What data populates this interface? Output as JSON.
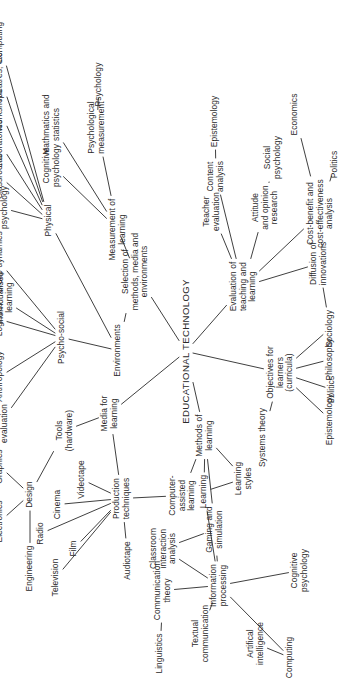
{
  "document": {
    "title": "EDUCATIONAL TECHNOLOGY",
    "type": "mind-map",
    "orientation": "rotated-90-ccw",
    "background_color": "#ffffff",
    "ink_color": "#2a2a2a"
  },
  "chart_data": {
    "type": "diagram",
    "title": "EDUCATIONAL TECHNOLOGY",
    "root": "EDUCATIONAL TECHNOLOGY",
    "nodes": [
      {
        "id": "root",
        "label": "EDUCATIONAL TECHNOLOGY",
        "x": 330,
        "y": 186,
        "cls": "root",
        "rot": 0
      },
      {
        "id": "media",
        "label": "Media for\nlearning",
        "x": 268,
        "y": 110,
        "rot": 0
      },
      {
        "id": "prodtec",
        "label": "Production\ntechniques",
        "x": 183,
        "y": 122,
        "rot": -32
      },
      {
        "id": "tv",
        "label": "Television",
        "x": 104,
        "y": 56,
        "rot": 0
      },
      {
        "id": "radio",
        "label": "Radio",
        "x": 148,
        "y": 41,
        "rot": 0
      },
      {
        "id": "film",
        "label": "Film",
        "x": 133,
        "y": 74,
        "rot": 0
      },
      {
        "id": "cinema",
        "label": "Cinema",
        "x": 177,
        "y": 58,
        "rot": 0
      },
      {
        "id": "video",
        "label": "Videotape",
        "x": 202,
        "y": 82,
        "rot": 0
      },
      {
        "id": "audio",
        "label": "Audiotape",
        "x": 121,
        "y": 128,
        "rot": 0
      },
      {
        "id": "cal",
        "label": "Computer-\nassisted\nlearning",
        "x": 186,
        "y": 182,
        "rot": 0
      },
      {
        "id": "tools",
        "label": "Tools\n(hardware)",
        "x": 251,
        "y": 65,
        "rot": 0
      },
      {
        "id": "design",
        "label": "Design",
        "x": 187,
        "y": 30,
        "rot": 0
      },
      {
        "id": "eng",
        "label": "Engineering",
        "x": 113,
        "y": 30,
        "rot": 0
      },
      {
        "id": "elec",
        "label": "Electronics",
        "x": 160,
        "y": 0,
        "rot": 0
      },
      {
        "id": "graph",
        "label": "Graphics",
        "x": 215,
        "y": 0,
        "rot": 0
      },
      {
        "id": "anthro",
        "label": "Anthropology",
        "x": 305,
        "y": 0,
        "rot": 0
      },
      {
        "id": "illum",
        "label": "Illuminative\nevaluation",
        "x": 258,
        "y": 0,
        "rot": 0
      },
      {
        "id": "envs",
        "label": "Environments",
        "x": 331,
        "y": 118,
        "rot": 0
      },
      {
        "id": "psysoc",
        "label": "Psycho-social",
        "x": 344,
        "y": 62,
        "rot": 0
      },
      {
        "id": "indep",
        "label": "Independent/\nindividualised\nlearning",
        "x": 384,
        "y": 0,
        "rot": 0
      },
      {
        "id": "logist",
        "label": "Logistics",
        "x": 362,
        "y": 0,
        "rot": 0
      },
      {
        "id": "groupd",
        "label": "Group dynamics",
        "x": 419,
        "y": 0,
        "rot": 0
      },
      {
        "id": "select",
        "label": "Selection of\nmethods, media and\nenvironments",
        "x": 410,
        "y": 135,
        "rot": 0
      },
      {
        "id": "phys",
        "label": "Physical",
        "x": 461,
        "y": 49,
        "rot": 0
      },
      {
        "id": "socpsy1",
        "label": "Social\npsychology",
        "x": 474,
        "y": 0,
        "rot": 0
      },
      {
        "id": "class",
        "label": "Classrooms",
        "x": 505,
        "y": 0,
        "rot": 0
      },
      {
        "id": "labs",
        "label": "Laboratories",
        "x": 538,
        "y": 0,
        "rot": 0
      },
      {
        "id": "wshop",
        "label": "Workshops",
        "x": 571,
        "y": 0,
        "rot": 0
      },
      {
        "id": "theat",
        "label": "Theatres, etc.",
        "x": 605,
        "y": 0,
        "rot": 0
      },
      {
        "id": "comput1",
        "label": "Computing",
        "x": 639,
        "y": 0,
        "rot": 0
      },
      {
        "id": "measure",
        "label": "Measurement of\nlearning",
        "x": 452,
        "y": 118,
        "rot": 0
      },
      {
        "id": "cogpsy1",
        "label": "Cognitive\npsychology",
        "x": 516,
        "y": 52,
        "rot": 0
      },
      {
        "id": "maths",
        "label": "Mathmatics and\nstatistics",
        "x": 557,
        "y": 52,
        "rot": 0
      },
      {
        "id": "psymeas",
        "label": "Psychological\nmeasurement",
        "x": 554,
        "y": 97,
        "rot": 0
      },
      {
        "id": "psy1",
        "label": "Psychology",
        "x": 597,
        "y": 99,
        "rot": 0
      },
      {
        "id": "evalt",
        "label": "Evaluation of\nteaching and\nlearning",
        "x": 395,
        "y": 243,
        "rot": 0
      },
      {
        "id": "teachev",
        "label": "Teacher\nevaluation",
        "x": 470,
        "y": 212,
        "rot": 0
      },
      {
        "id": "content",
        "label": "Content\nanalysis",
        "x": 505,
        "y": 216,
        "rot": 0
      },
      {
        "id": "episte2",
        "label": "Epistemology",
        "x": 560,
        "y": 215,
        "rot": 0
      },
      {
        "id": "attitud",
        "label": "Attitude\nand opinion\nresearch",
        "x": 474,
        "y": 265,
        "rot": 0
      },
      {
        "id": "socpsy2",
        "label": "Social\npsychology",
        "x": 524,
        "y": 273,
        "rot": 0
      },
      {
        "id": "cost",
        "label": "Cost-benefit and\ncost-effectiveness\nanalysis",
        "x": 468,
        "y": 320,
        "rot": 0
      },
      {
        "id": "polit2",
        "label": "Politics",
        "x": 517,
        "y": 335,
        "rot": 0
      },
      {
        "id": "econ",
        "label": "Economics",
        "x": 567,
        "y": 295,
        "rot": 0
      },
      {
        "id": "diffus",
        "label": "Diffusion of\ninnovations",
        "x": 418,
        "y": 319,
        "rot": 0
      },
      {
        "id": "sociol",
        "label": "Sociology",
        "x": 353,
        "y": 330,
        "rot": 0
      },
      {
        "id": "objs",
        "label": "Objectives for\nlearners\n(curricula)",
        "x": 309,
        "y": 280,
        "rot": 0
      },
      {
        "id": "systh",
        "label": "Systems theory",
        "x": 244,
        "y": 263,
        "rot": 0
      },
      {
        "id": "episte1",
        "label": "Epistemology",
        "x": 262,
        "y": 330,
        "rot": 0
      },
      {
        "id": "polit1",
        "label": "Politics",
        "x": 292,
        "y": 332,
        "rot": 0
      },
      {
        "id": "philos",
        "label": "Philosophy",
        "x": 322,
        "y": 330,
        "rot": 0
      },
      {
        "id": "methods",
        "label": "Methods of\nlearning",
        "x": 246,
        "y": 205,
        "rot": 0
      },
      {
        "id": "learn",
        "label": "Learning",
        "x": 190,
        "y": 204,
        "rot": 0
      },
      {
        "id": "lstyles",
        "label": "Learning\nstyles",
        "x": 203,
        "y": 244,
        "rot": 0
      },
      {
        "id": "gaming",
        "label": "Gaming and\nsimulation",
        "x": 152,
        "y": 215,
        "rot": 0
      },
      {
        "id": "classin",
        "label": "Classroom\ninteraction\nanalysis",
        "x": 133,
        "y": 163,
        "rot": 0
      },
      {
        "id": "infop",
        "label": "Information\nprocessing",
        "x": 96,
        "y": 219,
        "rot": 0
      },
      {
        "id": "commth",
        "label": "Communication\ntheory",
        "x": 91,
        "y": 163,
        "rot": 0
      },
      {
        "id": "ling",
        "label": "Linguistics",
        "x": 28,
        "y": 160,
        "rot": 0
      },
      {
        "id": "textc",
        "label": "Textual\ncommunication",
        "x": 48,
        "y": 201,
        "rot": 0
      },
      {
        "id": "ai",
        "label": "Artifical\nintelligence",
        "x": 38,
        "y": 256,
        "rot": 0
      },
      {
        "id": "comput2",
        "label": "Computing",
        "x": 24,
        "y": 290,
        "rot": 0
      },
      {
        "id": "cogpsy2",
        "label": "Cognitive\npsychology",
        "x": 111,
        "y": 300,
        "rot": 0
      }
    ],
    "edges": [
      [
        "root",
        "media"
      ],
      [
        "root",
        "select"
      ],
      [
        "root",
        "evalt"
      ],
      [
        "root",
        "methods"
      ],
      [
        "root",
        "objs"
      ],
      [
        "media",
        "prodtec"
      ],
      [
        "media",
        "tools"
      ],
      [
        "prodtec",
        "tv"
      ],
      [
        "prodtec",
        "radio"
      ],
      [
        "prodtec",
        "film"
      ],
      [
        "prodtec",
        "cinema"
      ],
      [
        "prodtec",
        "video"
      ],
      [
        "prodtec",
        "audio"
      ],
      [
        "prodtec",
        "cal"
      ],
      [
        "tools",
        "design"
      ],
      [
        "design",
        "eng"
      ],
      [
        "design",
        "elec"
      ],
      [
        "design",
        "graph"
      ],
      [
        "select",
        "envs"
      ],
      [
        "select",
        "measure"
      ],
      [
        "envs",
        "psysoc"
      ],
      [
        "envs",
        "phys"
      ],
      [
        "psysoc",
        "illum"
      ],
      [
        "psysoc",
        "anthro"
      ],
      [
        "psysoc",
        "indep"
      ],
      [
        "psysoc",
        "logist"
      ],
      [
        "psysoc",
        "groupd"
      ],
      [
        "phys",
        "socpsy1"
      ],
      [
        "phys",
        "class"
      ],
      [
        "phys",
        "labs"
      ],
      [
        "phys",
        "wshop"
      ],
      [
        "phys",
        "theat"
      ],
      [
        "phys",
        "comput1"
      ],
      [
        "measure",
        "cogpsy1"
      ],
      [
        "measure",
        "maths"
      ],
      [
        "measure",
        "psymeas"
      ],
      [
        "psymeas",
        "psy1"
      ],
      [
        "evalt",
        "teachev"
      ],
      [
        "evalt",
        "content"
      ],
      [
        "evalt",
        "attitud"
      ],
      [
        "evalt",
        "cost"
      ],
      [
        "evalt",
        "diffus"
      ],
      [
        "content",
        "episte2"
      ],
      [
        "attitud",
        "socpsy2"
      ],
      [
        "cost",
        "econ"
      ],
      [
        "cost",
        "polit2"
      ],
      [
        "diffus",
        "sociol"
      ],
      [
        "objs",
        "systh"
      ],
      [
        "objs",
        "episte1"
      ],
      [
        "objs",
        "polit1"
      ],
      [
        "objs",
        "philos"
      ],
      [
        "objs",
        "sociol"
      ],
      [
        "methods",
        "learn"
      ],
      [
        "methods",
        "lstyles"
      ],
      [
        "methods",
        "cal"
      ],
      [
        "methods",
        "gaming"
      ],
      [
        "learn",
        "infop"
      ],
      [
        "learn",
        "lstyles"
      ],
      [
        "infop",
        "classin"
      ],
      [
        "infop",
        "commth"
      ],
      [
        "infop",
        "textc"
      ],
      [
        "infop",
        "gaming"
      ],
      [
        "infop",
        "cogpsy2"
      ],
      [
        "infop",
        "comput2"
      ],
      [
        "commth",
        "ling"
      ],
      [
        "comput2",
        "ai"
      ],
      [
        "classin",
        "gaming"
      ]
    ]
  }
}
